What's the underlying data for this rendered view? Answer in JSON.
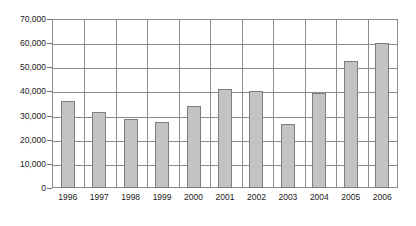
{
  "chart_data": {
    "type": "bar",
    "title": "",
    "subtitle": "",
    "xlabel": "",
    "ylabel": "",
    "categories": [
      "1996",
      "1997",
      "1998",
      "1999",
      "2000",
      "2001",
      "2002",
      "2003",
      "2004",
      "2005",
      "2006"
    ],
    "values": [
      36000,
      31500,
      28500,
      27500,
      34000,
      41000,
      40000,
      26500,
      39500,
      52500,
      60000
    ],
    "ylim": [
      0,
      70000
    ],
    "ytick_values": [
      0,
      10000,
      20000,
      30000,
      40000,
      50000,
      60000,
      70000
    ],
    "ytick_labels": [
      "0",
      "10,000",
      "20,000",
      "30,000",
      "40,000",
      "50,000",
      "60,000",
      "70,000"
    ],
    "grid": {
      "horizontal": true,
      "vertical": true
    },
    "legend": {
      "visible": false,
      "position": "none",
      "entries": []
    },
    "annotations": [],
    "colors": {
      "bar_fill": "#c3c3c3",
      "bar_border": "#7d7d7d",
      "grid": "#8c8c8c",
      "axis_text": "#1a1a1a",
      "background": "#ffffff"
    }
  }
}
